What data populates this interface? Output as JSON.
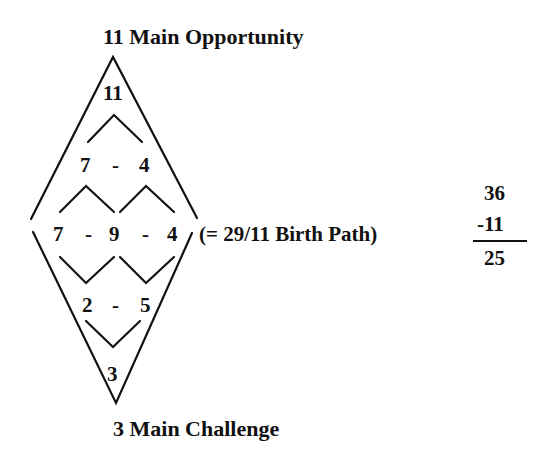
{
  "diagram": {
    "top_label": "11 Main Opportunity",
    "bottom_label": "3 Main Challenge",
    "apex_value": "11",
    "row2": {
      "left": "7",
      "sep": "-",
      "right": "4"
    },
    "row3": {
      "left": "7",
      "sep1": "-",
      "middle": "9",
      "sep2": "-",
      "right": "4"
    },
    "row4": {
      "left": "2",
      "sep": "-",
      "right": "5"
    },
    "bottom_value": "3",
    "birth_path_note": "(= 29/11 Birth Path)"
  },
  "calculation": {
    "minuend": "36",
    "subtrahend": "-11",
    "result": "25"
  }
}
